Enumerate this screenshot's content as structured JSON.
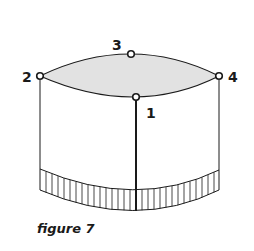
{
  "figure": {
    "caption": "figure 7",
    "points": [
      {
        "id": "1",
        "label": "1",
        "x": 136,
        "y": 97,
        "label_x": 146,
        "label_y": 118
      },
      {
        "id": "2",
        "label": "2",
        "x": 40,
        "y": 76,
        "label_x": 22,
        "label_y": 82
      },
      {
        "id": "3",
        "label": "3",
        "x": 131,
        "y": 54,
        "label_x": 112,
        "label_y": 50
      },
      {
        "id": "4",
        "label": "4",
        "x": 219,
        "y": 76,
        "label_x": 228,
        "label_y": 82
      }
    ],
    "colors": {
      "stroke": "#1a1a1a",
      "top_fill": "#e2e2e2",
      "background": "#ffffff"
    }
  }
}
